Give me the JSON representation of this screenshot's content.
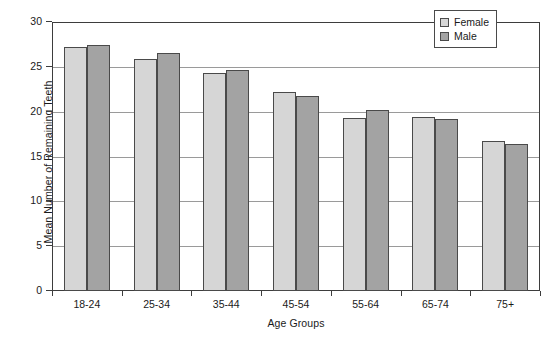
{
  "chart_data": {
    "type": "bar",
    "title": "",
    "xlabel": "Age Groups",
    "ylabel": "Mean Number of Remaining Teeth",
    "categories": [
      "18-24",
      "25-34",
      "35-44",
      "45-54",
      "55-64",
      "65-74",
      "75+"
    ],
    "series": [
      {
        "name": "Female",
        "color": "#d6d6d6",
        "values": [
          27.2,
          25.9,
          24.3,
          22.2,
          19.3,
          19.4,
          16.7
        ]
      },
      {
        "name": "Male",
        "color": "#a3a3a3",
        "values": [
          27.4,
          26.5,
          24.7,
          21.7,
          20.2,
          19.2,
          16.4
        ]
      }
    ],
    "ylim": [
      0,
      30
    ],
    "yticks": [
      0,
      5,
      10,
      15,
      20,
      25,
      30
    ],
    "ytick_labels": [
      "0",
      "5",
      "10",
      "15",
      "20",
      "25",
      "30"
    ],
    "grid": "horizontal",
    "legend_position": "top-right"
  },
  "legend": {
    "items": [
      {
        "label": "Female"
      },
      {
        "label": "Male"
      }
    ]
  }
}
